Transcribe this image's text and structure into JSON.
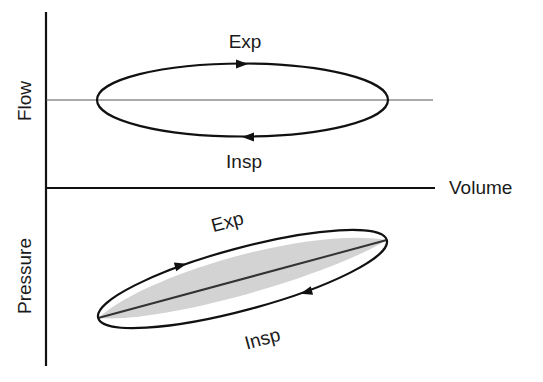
{
  "diagram": {
    "type": "flow-volume and pressure-volume loops",
    "axes": {
      "y_top_label": "Flow",
      "y_bottom_label": "Pressure",
      "x_label": "Volume"
    },
    "flow_loop": {
      "upper_label": "Exp",
      "lower_label": "Insp",
      "upper_arrow_direction": "right",
      "lower_arrow_direction": "left"
    },
    "pressure_loop": {
      "upper_label": "Exp",
      "lower_label": "Insp",
      "upper_arrow_direction": "up-right",
      "lower_arrow_direction": "down-left",
      "shaded_region": true,
      "diagonal_line": true
    },
    "colors": {
      "line": "#111111",
      "shade": "#d3d3d3",
      "axis_thin": "#555555"
    }
  }
}
